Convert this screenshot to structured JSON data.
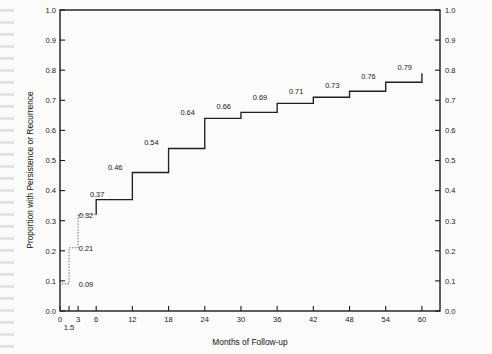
{
  "chart_data": {
    "type": "line",
    "subtype": "kaplan-meier-step",
    "title": "",
    "xlabel": "Months of Follow-up",
    "ylabel": "Proportion with Persistence or Recurrence",
    "xlim": [
      0,
      63
    ],
    "ylim": [
      0.0,
      1.0
    ],
    "grid": false,
    "legend": null,
    "x_ticks": [
      0,
      1.5,
      3,
      6,
      12,
      18,
      24,
      30,
      36,
      42,
      48,
      54,
      60
    ],
    "x_tick_labels": [
      "0",
      "1.5",
      "3",
      "6",
      "12",
      "18",
      "24",
      "30",
      "36",
      "42",
      "48",
      "54",
      "60"
    ],
    "y_ticks": [
      0.0,
      0.1,
      0.2,
      0.3,
      0.4,
      0.5,
      0.6,
      0.7,
      0.8,
      0.9,
      1.0
    ],
    "y_tick_labels": [
      "0.0",
      "0.1",
      "0.2",
      "0.3",
      "0.4",
      "0.5",
      "0.6",
      "0.7",
      "0.8",
      "0.9",
      "1.0"
    ],
    "right_axis_ticks": [
      0.0,
      0.1,
      0.2,
      0.3,
      0.4,
      0.5,
      0.6,
      0.7,
      0.8,
      0.9,
      1.0
    ],
    "right_axis_tick_labels": [
      "0.0",
      "0.1",
      "0.2",
      "0.3",
      "0.4",
      "0.5",
      "0.6",
      "0.7",
      "0.8",
      "0.9",
      "1.0"
    ],
    "series": [
      {
        "name": "Proportion with persistence or recurrence",
        "style": "step-post",
        "x": [
          0,
          1.5,
          3,
          6,
          12,
          18,
          24,
          30,
          36,
          42,
          48,
          54,
          60
        ],
        "y": [
          0.09,
          0.21,
          0.32,
          0.37,
          0.46,
          0.54,
          0.64,
          0.66,
          0.69,
          0.71,
          0.73,
          0.76,
          0.79
        ]
      }
    ],
    "point_labels": [
      {
        "x": 1.5,
        "y": 0.09,
        "text": "0.09"
      },
      {
        "x": 1.5,
        "y": 0.21,
        "text": "0.21"
      },
      {
        "x": 1.5,
        "y": 0.32,
        "text": "0.32"
      },
      {
        "x": 3,
        "y": 0.37,
        "text": "0.37"
      },
      {
        "x": 6,
        "y": 0.46,
        "text": "0.46"
      },
      {
        "x": 12,
        "y": 0.54,
        "text": "0.54"
      },
      {
        "x": 18,
        "y": 0.64,
        "text": "0.64"
      },
      {
        "x": 24,
        "y": 0.66,
        "text": "0.66"
      },
      {
        "x": 30,
        "y": 0.69,
        "text": "0.69"
      },
      {
        "x": 36,
        "y": 0.71,
        "text": "0.71"
      },
      {
        "x": 42,
        "y": 0.73,
        "text": "0.73"
      },
      {
        "x": 48,
        "y": 0.76,
        "text": "0.76"
      },
      {
        "x": 54,
        "y": 0.79,
        "text": "0.79"
      }
    ],
    "colors": {
      "line": "#1f1f1f",
      "early_segment": "#6f6f6f",
      "axis": "#1a1a1a",
      "text": "#161616",
      "background": "#fbfbfa"
    }
  }
}
